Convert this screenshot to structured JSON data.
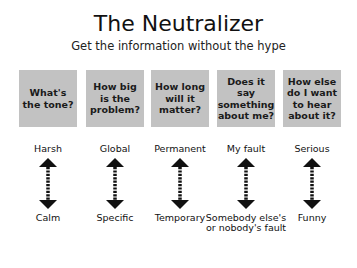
{
  "header": {
    "title": "The Neutralizer",
    "subtitle": "Get the information without the hype"
  },
  "columns": [
    {
      "question": "What's the tone?",
      "top": "Harsh",
      "bottom": "Calm"
    },
    {
      "question": "How big is the problem?",
      "top": "Global",
      "bottom": "Specific"
    },
    {
      "question": "How long will it matter?",
      "top": "Permanent",
      "bottom": "Temporary"
    },
    {
      "question": "Does it say something about me?",
      "top": "My fault",
      "bottom": "Somebody else's or nobody's fault"
    },
    {
      "question": "How else do I want to hear about it?",
      "top": "Serious",
      "bottom": "Funny"
    }
  ],
  "colors": {
    "box_fill": "#c2c2c2",
    "arrow": "#111111",
    "text": "#111111"
  }
}
